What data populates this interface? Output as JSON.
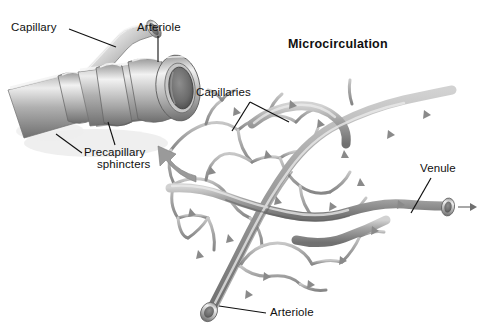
{
  "figure": {
    "title": "Microcirculation",
    "background_color": "#ffffff",
    "ink_color": "#101010",
    "vessel_color": "#8d8d8d",
    "vessel_dark_color": "#4a4a4a",
    "vessel_light_color": "#d8d8d8"
  },
  "left_panel": {
    "labels": {
      "capillary": "Capillary",
      "arteriole": "Arteriole",
      "precapillary_line1": "Precapillary",
      "precapillary_line2": "sphincters"
    }
  },
  "right_panel": {
    "labels": {
      "capillaries": "Capillaries",
      "venule": "Venule",
      "arteriole": "Arteriole"
    }
  }
}
